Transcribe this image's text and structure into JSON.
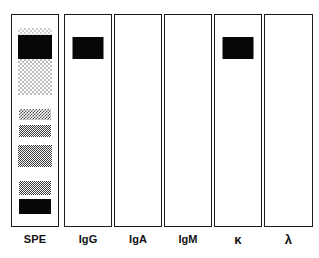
{
  "figure": {
    "name": "immunofixation-electrophoresis-gel",
    "background_color": "#ffffff",
    "border_color": "#1b1b1b",
    "band_color": "#070707",
    "width": 319,
    "height": 258
  },
  "lanes": [
    {
      "id": "lane-spe",
      "label": "SPE",
      "label_is_greek": false,
      "x": 11,
      "width": 48,
      "bands": [
        {
          "name": "band-spe-cap-stipple",
          "shade": "very-faint",
          "top": 13,
          "height": 7,
          "width": 34
        },
        {
          "name": "band-spe-m-spike",
          "shade": "solid",
          "top": 20,
          "height": 24,
          "width": 34
        },
        {
          "name": "band-spe-albumin-smear",
          "shade": "faint",
          "top": 44,
          "height": 36,
          "width": 34
        },
        {
          "name": "band-spe-alpha1",
          "shade": "medium",
          "top": 94,
          "height": 11,
          "width": 32
        },
        {
          "name": "band-spe-alpha2",
          "shade": "dense",
          "top": 110,
          "height": 12,
          "width": 32
        },
        {
          "name": "band-spe-beta",
          "shade": "dense",
          "top": 130,
          "height": 22,
          "width": 34
        },
        {
          "name": "band-spe-gamma-faint",
          "shade": "dense",
          "top": 166,
          "height": 14,
          "width": 32
        },
        {
          "name": "band-spe-gamma-solid",
          "shade": "solid",
          "top": 184,
          "height": 15,
          "width": 32
        }
      ]
    },
    {
      "id": "lane-igg",
      "label": "IgG",
      "label_is_greek": false,
      "x": 64,
      "width": 48,
      "bands": [
        {
          "name": "band-igg-m-spike",
          "shade": "solid",
          "top": 22,
          "height": 22,
          "width": 31
        }
      ]
    },
    {
      "id": "lane-iga",
      "label": "IgA",
      "label_is_greek": false,
      "x": 114,
      "width": 48,
      "bands": []
    },
    {
      "id": "lane-igm",
      "label": "IgM",
      "label_is_greek": false,
      "x": 164,
      "width": 48,
      "bands": []
    },
    {
      "id": "lane-kappa",
      "label": "κ",
      "label_is_greek": true,
      "x": 214,
      "width": 48,
      "bands": [
        {
          "name": "band-kappa-m-spike",
          "shade": "solid",
          "top": 22,
          "height": 22,
          "width": 31
        }
      ]
    },
    {
      "id": "lane-lambda",
      "label": "λ",
      "label_is_greek": true,
      "x": 264,
      "width": 49,
      "bands": []
    }
  ]
}
